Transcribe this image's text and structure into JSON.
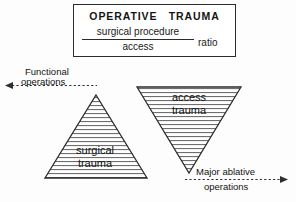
{
  "diagram": {
    "title_box": {
      "heading": "OPERATIVE   TRAUMA",
      "fraction": {
        "numerator": "surgical procedure",
        "denominator": "access"
      },
      "ratio_label": "ratio"
    },
    "triangles": [
      {
        "name": "surgical-trauma",
        "orientation": "up",
        "label_line1": "surgical",
        "label_line2": "trauma",
        "fill_pattern": "horizontal-hatch",
        "stroke_color": "#2b2b2b"
      },
      {
        "name": "access-trauma",
        "orientation": "down",
        "label_line1": "access",
        "label_line2": "trauma",
        "fill_pattern": "horizontal-hatch",
        "stroke_color": "#2b2b2b"
      }
    ],
    "annotations": [
      {
        "name": "functional-operations",
        "line1": "Functional",
        "line2": "operations",
        "arrow_direction": "left"
      },
      {
        "name": "major-ablative-operations",
        "line1": "Major ablative",
        "line2": "operations",
        "arrow_direction": "right"
      }
    ]
  }
}
